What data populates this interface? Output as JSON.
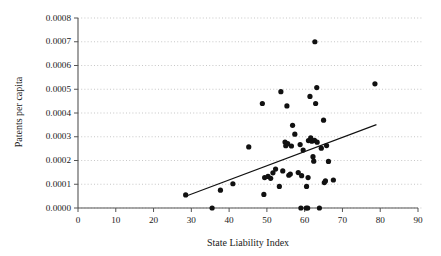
{
  "chart_data": {
    "type": "scatter",
    "title": "",
    "xlabel": "State Liability Index",
    "ylabel": "Patents per capita",
    "xlim": [
      0,
      90
    ],
    "ylim": [
      0,
      0.0008
    ],
    "xticks": [
      "0",
      "10",
      "20",
      "30",
      "40",
      "50",
      "60",
      "70",
      "80",
      "90"
    ],
    "xtick_values": [
      0,
      10,
      20,
      30,
      40,
      50,
      60,
      70,
      80,
      90
    ],
    "yticks": [
      "0.0000",
      "0.0001",
      "0.0002",
      "0.0003",
      "0.0004",
      "0.0005",
      "0.0006",
      "0.0007",
      "0.0008"
    ],
    "ytick_values": [
      0.0,
      0.0001,
      0.0002,
      0.0003,
      0.0004,
      0.0005,
      0.0006,
      0.0007,
      0.0008
    ],
    "grid": "horizontal-dotted",
    "legend": "none",
    "marker_color": "#111111",
    "grid_color": "#b9b9b9",
    "axis_color": "#555555",
    "points": [
      [
        28.5,
        5.5e-05
      ],
      [
        35.5,
        0.0
      ],
      [
        37.7,
        7.5e-05
      ],
      [
        41.0,
        0.000102
      ],
      [
        45.2,
        0.000257
      ],
      [
        48.8,
        0.00044
      ],
      [
        49.2,
        5.7e-05
      ],
      [
        49.4,
        0.000128
      ],
      [
        50.3,
        0.000133
      ],
      [
        51.0,
        0.000125
      ],
      [
        51.6,
        0.000148
      ],
      [
        52.3,
        0.000164
      ],
      [
        53.3,
        9.1e-05
      ],
      [
        53.7,
        0.00049
      ],
      [
        54.2,
        0.000156
      ],
      [
        54.8,
        0.000278
      ],
      [
        55.0,
        0.000262
      ],
      [
        55.3,
        0.00043
      ],
      [
        55.5,
        0.000271
      ],
      [
        55.8,
        0.000138
      ],
      [
        56.2,
        0.000143
      ],
      [
        56.5,
        0.000261
      ],
      [
        56.8,
        0.000348
      ],
      [
        57.4,
        0.000311
      ],
      [
        58.3,
        0.000149
      ],
      [
        58.8,
        0.000267
      ],
      [
        59.0,
        0.0
      ],
      [
        59.2,
        0.000136
      ],
      [
        59.6,
        0.000244
      ],
      [
        60.4,
        0.0
      ],
      [
        60.5,
        9.1e-05
      ],
      [
        60.8,
        0.0
      ],
      [
        60.9,
        0.000128
      ],
      [
        61.0,
        0.000284
      ],
      [
        61.4,
        0.00047
      ],
      [
        61.6,
        0.000295
      ],
      [
        61.9,
        0.000281
      ],
      [
        62.2,
        0.000216
      ],
      [
        62.4,
        0.000197
      ],
      [
        62.6,
        0.000285
      ],
      [
        62.7,
        0.0007
      ],
      [
        62.9,
        0.00044
      ],
      [
        63.2,
        0.000507
      ],
      [
        63.3,
        0.000277
      ],
      [
        63.9,
        0.0
      ],
      [
        64.4,
        0.000252
      ],
      [
        65.0,
        0.00037
      ],
      [
        65.2,
        0.000107
      ],
      [
        65.5,
        0.000114
      ],
      [
        65.8,
        0.000263
      ],
      [
        66.3,
        0.000196
      ],
      [
        67.6,
        0.000118
      ],
      [
        78.6,
        0.000523
      ]
    ],
    "trendline": {
      "x_start": 28.5,
      "y_start": 4.95e-05,
      "x_end": 79.0,
      "y_end": 0.000351
    }
  }
}
